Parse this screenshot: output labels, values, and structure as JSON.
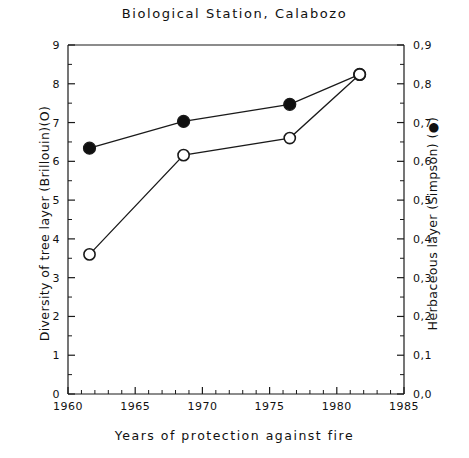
{
  "chart_data": {
    "type": "line",
    "title": "Biological  Station,  Calabozo",
    "xlabel": "Years  of  protection  against  fire",
    "ylabel_left": "Diversity of tree layer (Brillouin)(O)",
    "ylabel_right": "Herbaceous layer (Simpson) (●)",
    "xlim": [
      1960,
      1985
    ],
    "xticks": [
      1960,
      1965,
      1970,
      1975,
      1980,
      1985
    ],
    "xticklabels": [
      "1960",
      "1965",
      "1970",
      "1975",
      "1980",
      "1985"
    ],
    "x_minor_step": 1,
    "ylim_left": [
      0,
      9
    ],
    "yticks_left": [
      0,
      1,
      2,
      3,
      4,
      5,
      6,
      7,
      8,
      9
    ],
    "yticklabels_left": [
      "0",
      "1",
      "2",
      "3",
      "4",
      "5",
      "6",
      "7",
      "8",
      "9"
    ],
    "y_left_minor_step": 0.5,
    "ylim_right": [
      0.0,
      0.9
    ],
    "yticks_right": [
      0.0,
      0.1,
      0.2,
      0.3,
      0.4,
      0.5,
      0.6,
      0.7,
      0.8,
      0.9
    ],
    "yticklabels_right": [
      "0,0",
      "0,1",
      "0,2",
      "0,3",
      "0,4",
      "0,5",
      "0,6",
      "0,7",
      "0,8",
      "0,9"
    ],
    "y_right_minor_step": 0.05,
    "grid": false,
    "legend": "none",
    "series": [
      {
        "name": "Herbaceous layer (Simpson)",
        "marker": "filled-circle",
        "axis": "right",
        "x": [
          1961.6,
          1968.6,
          1976.5,
          1981.7
        ],
        "values": [
          0.634,
          0.703,
          0.747,
          0.824
        ]
      },
      {
        "name": "Diversity of tree layer (Brillouin)",
        "marker": "open-circle",
        "axis": "left",
        "x": [
          1961.6,
          1968.6,
          1976.5,
          1981.7
        ],
        "values": [
          3.6,
          6.16,
          6.6,
          8.24
        ]
      }
    ]
  },
  "colors": {
    "axis": "#1a1a1a",
    "line": "#1a1a1a",
    "marker_fill": "#101010",
    "marker_open_fill": "#ffffff",
    "background": "#ffffff"
  }
}
